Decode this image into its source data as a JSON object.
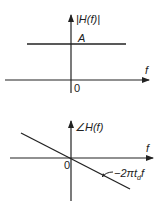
{
  "magnitude_plot": {
    "y_label": "|H(f)|",
    "x_label": "f",
    "origin_label": "0",
    "level_label": "A",
    "description": "Constant magnitude A across all frequencies"
  },
  "phase_plot": {
    "y_label": "∠H(f)",
    "x_label": "f",
    "origin_label": "0",
    "line_label_prefix": "−2πt",
    "line_label_sub": "d",
    "line_label_suffix": "f",
    "description": "Linear phase with negative slope −2πt_d through origin"
  },
  "colors": {
    "ink": "#222222",
    "background": "#ffffff"
  }
}
